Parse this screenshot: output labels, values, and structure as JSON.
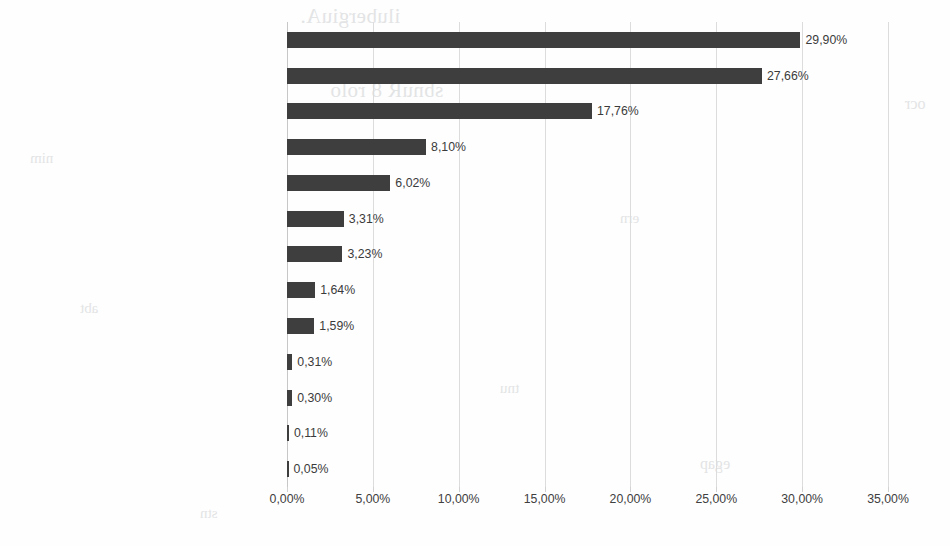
{
  "chart_data": {
    "type": "bar",
    "orientation": "horizontal",
    "title": "",
    "xlabel": "",
    "ylabel": "",
    "xlim": [
      0,
      35
    ],
    "xtick_labels": [
      "0,00%",
      "5,00%",
      "10,00%",
      "15,00%",
      "20,00%",
      "25,00%",
      "30,00%",
      "35,00%"
    ],
    "xtick_values": [
      0,
      5,
      10,
      15,
      20,
      25,
      30,
      35
    ],
    "grid": true,
    "legend": false,
    "bar_color": "#3e3e3e",
    "gridline_color": "#dcdcdc",
    "text_color": "#404040",
    "categories": [
      "ECDHE-RSA-AES128-GCM-SHA256",
      "ECDHE-RSA-AES256-GCM-SHA384",
      "DHE-RSA-AES256-SHA",
      "DHE-RSA-AES256-GCM-SHA384",
      "ECDHE-RSA-AES128-SHA",
      "ECDHE-RSA-AES256-SHA",
      "ECDHE-RSA-AES256-SHA384",
      "DHE-RSA-AES128-SHA",
      "ECDHE-RSA-AES128-SHA256",
      "DHE-RSA-AES128-GCM-SHA256",
      "DHE-RSA-CAMELLIA256-SHA",
      "DHE-RSA-AES128-SHA256",
      "DHE-RSA-AES256-SHA256"
    ],
    "values": [
      29.9,
      27.66,
      17.76,
      8.1,
      6.02,
      3.31,
      3.23,
      1.64,
      1.59,
      0.31,
      0.3,
      0.11,
      0.05
    ],
    "data_labels": [
      "29,90%",
      "27,66%",
      "17,76%",
      "8,10%",
      "6,02%",
      "3,31%",
      "3,23%",
      "1,64%",
      "1,59%",
      "0,31%",
      "0,30%",
      "0,11%",
      "0,05%"
    ]
  },
  "background_artifacts": {
    "note": "faint illegible scanner bleed-through from reverse page",
    "marks": [
      "ilubergiuA.",
      "sbnuR 8 rolo",
      "nim",
      "ern",
      "abt",
      "tnu",
      "stn",
      "egap",
      "ocr"
    ]
  }
}
